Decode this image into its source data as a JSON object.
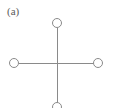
{
  "figure": {
    "panel_label": "(a)",
    "width": 113,
    "height": 108,
    "background_color": "#ffffff",
    "line_color": "#8a8a8a",
    "node_fill_color": "#ffffff",
    "node_stroke_color": "#8a8a8a",
    "label_color": "#5a5a5a",
    "center": {
      "x": 57,
      "y": 63
    },
    "node_radius": 4.5,
    "nodes": [
      {
        "id": "node-top",
        "x": 57,
        "y": 23,
        "clipped": false
      },
      {
        "id": "node-left",
        "x": 14,
        "y": 63,
        "clipped": false
      },
      {
        "id": "node-right",
        "x": 98,
        "y": 63,
        "clipped": false
      },
      {
        "id": "node-bottom",
        "x": 57,
        "y": 107,
        "clipped": true
      }
    ],
    "edges": [
      {
        "id": "edge-top",
        "x1": 57,
        "y1": 27.5,
        "x2": 57,
        "y2": 63
      },
      {
        "id": "edge-left",
        "x1": 18.5,
        "y1": 63,
        "x2": 57,
        "y2": 63
      },
      {
        "id": "edge-right",
        "x1": 57,
        "y1": 63,
        "x2": 93.5,
        "y2": 63
      },
      {
        "id": "edge-bottom",
        "x1": 57,
        "y1": 63,
        "x2": 57,
        "y2": 102.5
      }
    ]
  }
}
